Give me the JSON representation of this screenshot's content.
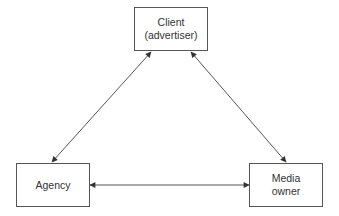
{
  "diagram": {
    "nodes": [
      {
        "id": "client",
        "lines": [
          "Client",
          "(advertiser)"
        ]
      },
      {
        "id": "agency",
        "lines": [
          "Agency"
        ]
      },
      {
        "id": "media_owner",
        "lines": [
          "Media",
          "owner"
        ]
      }
    ],
    "edges": [
      {
        "from": "client",
        "to": "agency",
        "direction": "bidirectional"
      },
      {
        "from": "client",
        "to": "media_owner",
        "direction": "bidirectional"
      },
      {
        "from": "agency",
        "to": "media_owner",
        "direction": "bidirectional"
      }
    ],
    "colors": {
      "stroke": "#555555",
      "text": "#333333",
      "background": "#ffffff"
    }
  }
}
